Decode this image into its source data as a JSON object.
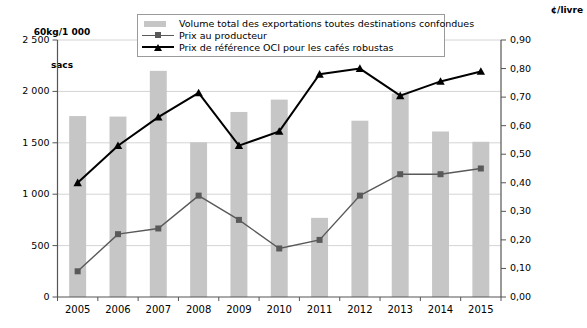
{
  "chart_data": {
    "type": "bar",
    "title": "",
    "categories": [
      "2005",
      "2006",
      "2007",
      "2008",
      "2009",
      "2010",
      "2011",
      "2012",
      "2013",
      "2014",
      "2015"
    ],
    "left_axis": {
      "label": "60kg/1 000\nsacs",
      "ticks": [
        "0",
        "500",
        "1 000",
        "1 500",
        "2 000",
        "2 500"
      ],
      "ylim": [
        0,
        2500
      ],
      "step": 500
    },
    "right_axis": {
      "label": "¢/livre",
      "ticks": [
        "0,00",
        "0,10",
        "0,20",
        "0,30",
        "0,40",
        "0,50",
        "0,60",
        "0,70",
        "0,80",
        "0,90"
      ],
      "ylim": [
        0,
        0.9
      ],
      "step": 0.1
    },
    "grid": true,
    "legend_position": "top-center",
    "series": [
      {
        "name": "Volume total des exportations toutes destinations confondues",
        "type": "bar",
        "axis": "left",
        "color": "#c6c6c6",
        "values": [
          1760,
          1755,
          2200,
          1505,
          1800,
          1920,
          770,
          1715,
          1980,
          1610,
          1510
        ]
      },
      {
        "name": "Prix au producteur",
        "type": "line",
        "axis": "right",
        "color": "#595959",
        "marker": "square",
        "values": [
          0.09,
          0.22,
          0.24,
          0.355,
          0.27,
          0.17,
          0.2,
          0.355,
          0.43,
          0.43,
          0.45
        ]
      },
      {
        "name": "Prix de référence OCI pour les cafés robustas",
        "type": "line",
        "axis": "right",
        "color": "#000000",
        "marker": "triangle",
        "values": [
          0.4,
          0.53,
          0.63,
          0.715,
          0.53,
          0.58,
          0.78,
          0.8,
          0.705,
          0.755,
          0.79
        ]
      }
    ]
  },
  "legend": {
    "items": [
      {
        "label": "Volume total des exportations toutes destinations confondues",
        "key": "swatch"
      },
      {
        "label": "Prix au producteur",
        "key": "line-square"
      },
      {
        "label": "Prix de référence OCI pour les cafés robustas",
        "key": "line-triangle"
      }
    ]
  },
  "units": {
    "left_line1": "60kg/1 000",
    "left_line2": "sacs",
    "right": "¢/livre"
  }
}
